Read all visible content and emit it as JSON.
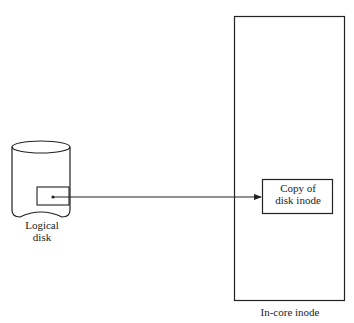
{
  "diagram": {
    "logical_disk": {
      "label_line1": "Logical",
      "label_line2": "disk"
    },
    "inner_box": {
      "label_line1": "Copy of",
      "label_line2": "disk inode"
    },
    "in_core_inode": {
      "label": "In-core inode"
    },
    "colors": {
      "stroke": "#222222",
      "background": "#ffffff"
    }
  }
}
